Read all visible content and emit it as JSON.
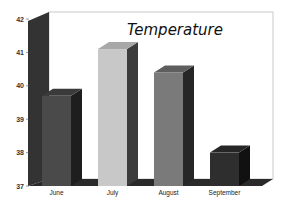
{
  "chart_data": {
    "type": "bar",
    "style": "3d-column",
    "title": "Temperature",
    "xlabel": "",
    "ylabel": "",
    "categories": [
      "June",
      "July",
      "August",
      "September"
    ],
    "values": [
      39.7,
      41.1,
      40.4,
      38.0
    ],
    "ylim": [
      37,
      42
    ],
    "yticks": [
      37,
      38,
      39,
      40,
      41,
      42
    ],
    "grid": false,
    "legend": null,
    "bar_colors": [
      "#4a4a4a",
      "#c8c8c8",
      "#7a7a7a",
      "#2e2e2e"
    ],
    "bar_side_colors": [
      "#1e1e1e",
      "#3c3c3c",
      "#262626",
      "#111111"
    ],
    "bar_top_colors": [
      "#3a3a3a",
      "#a8a8a8",
      "#5e5e5e",
      "#262626"
    ]
  },
  "colors": {
    "background": "#ffffff",
    "back_wall": "#ffffff",
    "wall_border": "#bbbbbb",
    "axis_wall": "#333333",
    "floor": "#2a2a2a"
  }
}
